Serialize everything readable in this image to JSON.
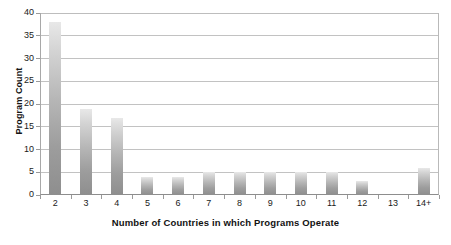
{
  "chart_data": {
    "type": "bar",
    "title": "",
    "xlabel": "Number of Countries in which Programs Operate",
    "ylabel": "Program Count",
    "categories": [
      "2",
      "3",
      "4",
      "5",
      "6",
      "7",
      "8",
      "9",
      "10",
      "11",
      "12",
      "13",
      "14+"
    ],
    "values": [
      38,
      19,
      17,
      4,
      4,
      5,
      5,
      5,
      5,
      5,
      3,
      0,
      6
    ],
    "ylim": [
      0,
      40
    ],
    "ytick_labels": [
      "0",
      "5",
      "10",
      "15",
      "20",
      "25",
      "30",
      "35",
      "40"
    ],
    "ytick_values": [
      0,
      5,
      10,
      15,
      20,
      25,
      30,
      35,
      40
    ],
    "grid": "horizontal",
    "legend": "none",
    "bar_color_top": "#e8e8e8",
    "bar_color_bottom": "#8e8e8e",
    "gridline_color": "#c2c2c2",
    "axis_color": "#8d8d8d",
    "background_color": "#ffffff"
  }
}
